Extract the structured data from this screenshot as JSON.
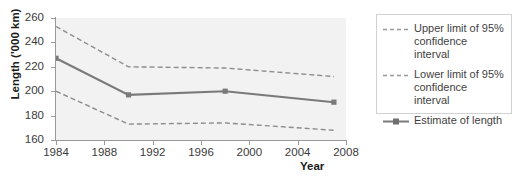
{
  "chart_data": {
    "type": "line",
    "title": "",
    "xlabel": "Year",
    "ylabel": "Length ('000 km)",
    "xlim": [
      1984,
      2008
    ],
    "ylim": [
      160,
      260
    ],
    "xticks": [
      1984,
      1988,
      1992,
      1996,
      2000,
      2004,
      2008
    ],
    "yticks": [
      160,
      180,
      200,
      220,
      240,
      260
    ],
    "grid": false,
    "legend_position": "right",
    "x": [
      1984,
      1990,
      1998,
      2007
    ],
    "series": [
      {
        "name": "Upper limit of 95% confidence interval",
        "style": "dashed",
        "color": "#8c8c8c",
        "values": [
          253,
          220,
          219,
          212
        ]
      },
      {
        "name": "Lower limit of 95% confidence interval",
        "style": "dashed",
        "color": "#8c8c8c",
        "values": [
          200,
          173,
          174,
          168
        ]
      },
      {
        "name": "Estimate of length",
        "style": "solid-marker",
        "color": "#7a7a7a",
        "values": [
          227,
          197,
          200,
          191
        ]
      }
    ],
    "colors": {
      "plot_background": "#f2f2f2",
      "axis": "#9a9a9a",
      "line": "#7a7a7a",
      "text": "#3a3a3a"
    }
  },
  "axes": {
    "y_title": "Length ('000 km)",
    "x_title": "Year",
    "y_tick_labels": [
      "260",
      "240",
      "220",
      "200",
      "180",
      "160"
    ],
    "x_tick_labels": [
      "1984",
      "1988",
      "1992",
      "1996",
      "2000",
      "2004",
      "2008"
    ]
  },
  "legend": {
    "items": [
      {
        "label": "Upper limit of 95% confidence interval",
        "key": "dashed-line-icon"
      },
      {
        "label": "Lower limit of 95% confidence interval",
        "key": "dashed-line-icon"
      },
      {
        "label": "Estimate of length",
        "key": "solid-line-marker-icon"
      }
    ]
  }
}
